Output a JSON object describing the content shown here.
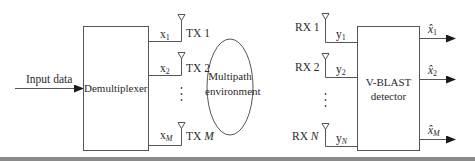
{
  "diagram": {
    "type": "block-diagram",
    "input": {
      "label": "Input data"
    },
    "blocks": {
      "demultiplexer": {
        "label": "Demultiplexer"
      },
      "channel": {
        "label_line1": "Multipath",
        "label_line2": "environment"
      },
      "detector": {
        "label_line1": "V-BLAST",
        "label_line2": "detector"
      }
    },
    "transmit": [
      {
        "signal": "x",
        "sub": "1",
        "antenna": "TX 1",
        "antenna_base": "TX ",
        "antenna_idx": "1"
      },
      {
        "signal": "x",
        "sub": "2",
        "antenna": "TX 2",
        "antenna_base": "TX ",
        "antenna_idx": "2"
      },
      {
        "signal": "x",
        "sub": "M",
        "antenna": "TX M",
        "antenna_base": "TX ",
        "antenna_idx": "M"
      }
    ],
    "receive": [
      {
        "signal": "y",
        "sub": "1",
        "antenna": "RX 1",
        "antenna_base": "RX ",
        "antenna_idx": "1"
      },
      {
        "signal": "y",
        "sub": "2",
        "antenna": "RX 2",
        "antenna_base": "RX ",
        "antenna_idx": "2"
      },
      {
        "signal": "y",
        "sub": "N",
        "antenna": "RX N",
        "antenna_base": "RX ",
        "antenna_idx": "N"
      }
    ],
    "outputs": [
      {
        "signal": "x̂",
        "sub": "1"
      },
      {
        "signal": "x̂",
        "sub": "2"
      },
      {
        "signal": "x̂",
        "sub": "M"
      }
    ],
    "ellipsis": "⋮",
    "colors": {
      "line": "#555555",
      "text": "#2a2a2a",
      "bottom_bar": "#8a8a8a"
    }
  }
}
